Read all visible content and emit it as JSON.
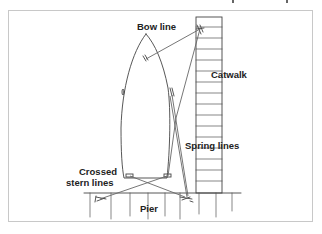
{
  "diagram": {
    "labels": {
      "bow_line": "Bow line",
      "catwalk": "Catwalk",
      "spring_lines": "Spring lines",
      "crossed_stern_lines_1": "Crossed",
      "crossed_stern_lines_2": "stern lines",
      "pier": "Pier"
    },
    "colors": {
      "line": "#555555",
      "frame": "#c8c8c8",
      "text": "#222222",
      "background": "#ffffff"
    }
  }
}
